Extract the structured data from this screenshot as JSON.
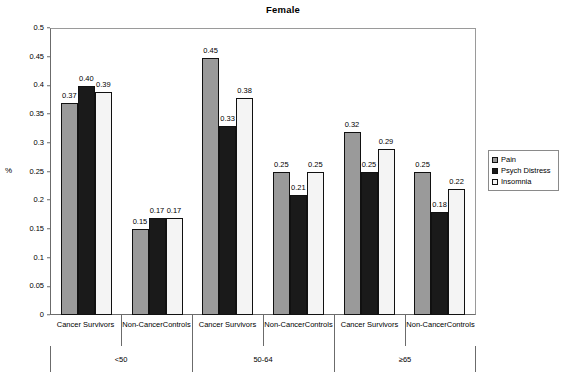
{
  "chart_data": {
    "type": "bar",
    "title": "Female",
    "xlabel": "",
    "ylabel": "%",
    "ylim": [
      0,
      0.5
    ],
    "ytick_labels": [
      "0.5",
      "0.45",
      "0.4",
      "0.35",
      "0.3",
      "0.25",
      "0.2",
      "0.15",
      "0.1",
      "0.05",
      "0"
    ],
    "ytick_values": [
      0.5,
      0.45,
      0.4,
      0.35,
      0.3,
      0.25,
      0.2,
      0.15,
      0.1,
      0.05,
      0
    ],
    "grid": false,
    "legend_position": "right",
    "categories": [
      "Cancer Survivors",
      "Non-Cancer Controls",
      "Cancer Survivors",
      "Non-Cancer Controls",
      "Cancer Survivors",
      "Non-Cancer Controls"
    ],
    "group_labels": [
      "<50",
      "50-64",
      "≥65"
    ],
    "series": [
      {
        "name": "Pain",
        "color": "#9a9a9a",
        "values": [
          0.37,
          0.15,
          0.45,
          0.25,
          0.32,
          0.25
        ]
      },
      {
        "name": "Psych Distress",
        "color": "#1a1a1a",
        "values": [
          0.4,
          0.17,
          0.33,
          0.21,
          0.25,
          0.18
        ]
      },
      {
        "name": "Insomnia",
        "color": "#f4f4f4",
        "values": [
          0.39,
          0.17,
          0.38,
          0.25,
          0.29,
          0.22
        ]
      }
    ],
    "data_labels": [
      [
        "0.37",
        "0.15",
        "0.45",
        "0.25",
        "0.32",
        "0.25"
      ],
      [
        "0.40",
        "0.17",
        "0.33",
        "0.21",
        "0.25",
        "0.18"
      ],
      [
        "0.39",
        "0.17",
        "0.38",
        "0.25",
        "0.29",
        "0.22"
      ]
    ]
  },
  "legend": {
    "items": [
      {
        "label": "Pain",
        "color": "#9a9a9a"
      },
      {
        "label": "Psych Distress",
        "color": "#1a1a1a"
      },
      {
        "label": "Insomnia",
        "color": "#f4f4f4"
      }
    ]
  }
}
